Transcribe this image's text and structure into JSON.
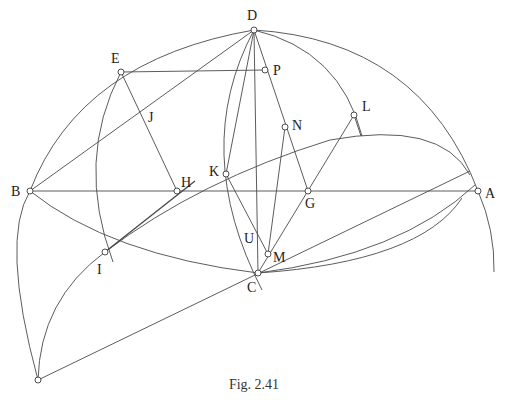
{
  "figure": {
    "caption": "Fig. 2.41",
    "points": [
      {
        "name": "D",
        "label": "D",
        "x": 254,
        "y": 30,
        "lx": 247,
        "ly": 20
      },
      {
        "name": "E",
        "label": "E",
        "x": 121,
        "y": 72,
        "lx": 111,
        "ly": 63
      },
      {
        "name": "P",
        "label": "P",
        "x": 265,
        "y": 70,
        "lx": 273,
        "ly": 75
      },
      {
        "name": "J",
        "label": "J",
        "x": null,
        "y": null,
        "lx": 148,
        "ly": 122
      },
      {
        "name": "N",
        "label": "N",
        "x": 285,
        "y": 127,
        "lx": 292,
        "ly": 130
      },
      {
        "name": "L",
        "label": "L",
        "x": 354,
        "y": 115,
        "lx": 362,
        "ly": 111
      },
      {
        "name": "B",
        "label": "B",
        "x": 30,
        "y": 191,
        "lx": 11,
        "ly": 196
      },
      {
        "name": "H",
        "label": "H",
        "x": 177,
        "y": 191,
        "lx": 181,
        "ly": 187
      },
      {
        "name": "K",
        "label": "K",
        "x": 226,
        "y": 174,
        "lx": 209,
        "ly": 176
      },
      {
        "name": "G",
        "label": "G",
        "x": 308,
        "y": 191,
        "lx": 305,
        "ly": 208
      },
      {
        "name": "A",
        "label": "A",
        "x": 478,
        "y": 191,
        "lx": 485,
        "ly": 198
      },
      {
        "name": "I",
        "label": "I",
        "x": 105,
        "y": 252,
        "lx": 97,
        "ly": 274
      },
      {
        "name": "U",
        "label": "U",
        "x": null,
        "y": null,
        "lx": 244,
        "ly": 243
      },
      {
        "name": "M",
        "label": "M",
        "x": 268,
        "y": 254,
        "lx": 273,
        "ly": 262
      },
      {
        "name": "C",
        "label": "C",
        "x": 258,
        "y": 273,
        "lx": 247,
        "ly": 292
      },
      {
        "name": "Q",
        "label": "",
        "x": 38,
        "y": 380,
        "lx": null,
        "ly": null
      }
    ]
  },
  "colors": {
    "line": "#4a4a4a",
    "text": "#222222",
    "background": "#ffffff"
  }
}
